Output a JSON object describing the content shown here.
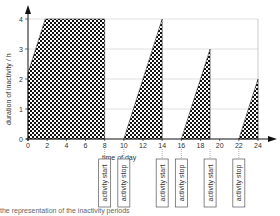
{
  "chart_data": {
    "type": "area",
    "title": "",
    "xlabel": "time of day",
    "ylabel": "duration of inactivity / h",
    "xlim": [
      0,
      24
    ],
    "ylim": [
      0,
      4
    ],
    "x_ticks": [
      "0",
      "2",
      "4",
      "6",
      "8",
      "10",
      "12",
      "14",
      "16",
      "18",
      "20",
      "22",
      "24"
    ],
    "y_ticks": [
      "0",
      "1",
      "2",
      "3",
      "4"
    ],
    "grid": true,
    "series": [
      {
        "name": "inactivity period 1",
        "points": [
          [
            0,
            2.2
          ],
          [
            1.8,
            4
          ],
          [
            8,
            4
          ],
          [
            8,
            0
          ],
          [
            0,
            0
          ]
        ]
      },
      {
        "name": "inactivity period 2",
        "points": [
          [
            10,
            0
          ],
          [
            14,
            4
          ],
          [
            14,
            0
          ]
        ]
      },
      {
        "name": "inactivity period 3",
        "points": [
          [
            16,
            0
          ],
          [
            19,
            3
          ],
          [
            19,
            0
          ]
        ]
      },
      {
        "name": "inactivity period 4",
        "points": [
          [
            22,
            0
          ],
          [
            24,
            2
          ],
          [
            24,
            0
          ]
        ]
      }
    ],
    "annotations": [
      {
        "x": 8,
        "text": "activity start"
      },
      {
        "x": 10,
        "text": "activity stop"
      },
      {
        "x": 14,
        "text": "activity start"
      },
      {
        "x": 16,
        "text": "activity stop"
      },
      {
        "x": 19,
        "text": "activity start"
      },
      {
        "x": 22,
        "text": "activity stop"
      }
    ]
  },
  "caption": "the representation of the inactivity periods"
}
